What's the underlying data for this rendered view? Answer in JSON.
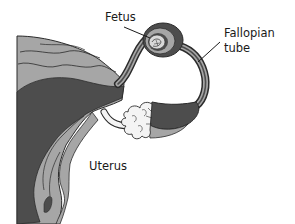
{
  "diagram": {
    "labels": {
      "fetus": "Fetus",
      "fallopian_tube_line1": "Fallopian",
      "fallopian_tube_line2": "tube",
      "uterus": "Uterus"
    },
    "colors": {
      "background": "#ffffff",
      "tissue_light": "#a6a6a6",
      "tissue_dark": "#4d4d4d",
      "outline": "#2b2b2b",
      "ovary_fill": "#f4f4f4",
      "label_text": "#1a1a1a"
    }
  }
}
